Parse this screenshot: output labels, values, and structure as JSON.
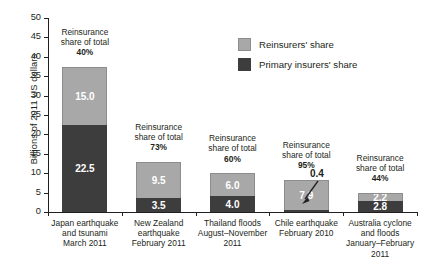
{
  "chart_data": {
    "type": "bar",
    "subtype": "stacked",
    "title": "",
    "xlabel": "",
    "ylabel": "Billions of 2011 US dollars",
    "ylim": [
      0,
      50
    ],
    "ytick_step": 5,
    "yticks": [
      "50",
      "45",
      "40",
      "35",
      "30",
      "25",
      "20",
      "15",
      "10",
      "5",
      "0"
    ],
    "grid": false,
    "legend_position": "top-right",
    "categories": [
      "Japan earthquake\nand tsunami\nMarch 2011",
      "New Zealand\nearthquake\nFebruary 2011",
      "Thailand floods\nAugust–November\n2011",
      "Chile earthquake\nFebruary 2010",
      "Australia cyclone\nand floods\nJanuary–February\n2011"
    ],
    "series": [
      {
        "name": "Reinsurers' share",
        "color": "#a8a8a8",
        "values": [
          15.0,
          9.5,
          6.0,
          7.9,
          2.2
        ]
      },
      {
        "name": "Primary insurers' share",
        "color": "#3d3d3d",
        "values": [
          22.5,
          3.5,
          4.0,
          0.4,
          2.8
        ]
      }
    ],
    "annotations": {
      "reinsurance_share_label": "Reinsurance\nshare of total",
      "reinsurance_share_pct": [
        "40%",
        "73%",
        "60%",
        "95%",
        "44%"
      ],
      "callout_value": "0.4"
    }
  },
  "axis": {
    "y_title": "Billions of 2011 US dollars",
    "y_ticks": [
      "50",
      "45",
      "40",
      "35",
      "30",
      "25",
      "20",
      "15",
      "10",
      "5",
      "0"
    ]
  },
  "legend": {
    "items": [
      {
        "label": "Reinsurers' share",
        "color": "#a8a8a8",
        "swatch": "legend-swatch-reinsurers"
      },
      {
        "label": "Primary insurers' share",
        "color": "#3d3d3d",
        "swatch": "legend-swatch-primary"
      }
    ]
  },
  "bars": [
    {
      "id": "japan",
      "category_line1": "Japan earthquake",
      "category_line2": "and tsunami",
      "category_line3": "March 2011",
      "category_line4": "",
      "reinsurers_value": "15.0",
      "primary_value": "22.5",
      "anno_line1": "Reinsurance",
      "anno_line2": "share of total",
      "anno_pct": "40%"
    },
    {
      "id": "new-zealand",
      "category_line1": "New Zealand",
      "category_line2": "earthquake",
      "category_line3": "February 2011",
      "category_line4": "",
      "reinsurers_value": "9.5",
      "primary_value": "3.5",
      "anno_line1": "Reinsurance",
      "anno_line2": "share of total",
      "anno_pct": "73%"
    },
    {
      "id": "thailand",
      "category_line1": "Thailand floods",
      "category_line2": "August–November",
      "category_line3": "2011",
      "category_line4": "",
      "reinsurers_value": "6.0",
      "primary_value": "4.0",
      "anno_line1": "Reinsurance",
      "anno_line2": "share of total",
      "anno_pct": "60%"
    },
    {
      "id": "chile",
      "category_line1": "Chile earthquake",
      "category_line2": "February 2010",
      "category_line3": "",
      "category_line4": "",
      "reinsurers_value": "7.9",
      "primary_value": "0.4",
      "anno_line1": "Reinsurance",
      "anno_line2": "share of total",
      "anno_pct": "95%"
    },
    {
      "id": "australia",
      "category_line1": "Australia cyclone",
      "category_line2": "and floods",
      "category_line3": "January–February",
      "category_line4": "2011",
      "reinsurers_value": "2.2",
      "primary_value": "2.8",
      "anno_line1": "Reinsurance",
      "anno_line2": "share of total",
      "anno_pct": "44%"
    }
  ],
  "callout": {
    "value": "0.4"
  }
}
